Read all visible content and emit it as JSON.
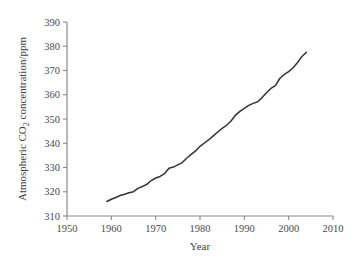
{
  "chart_data": {
    "type": "line",
    "title": "",
    "xlabel": "Year",
    "ylabel": "Atmospheric CO2 concentration/ppm",
    "ylabel_parts": {
      "pre": "Atmospheric CO",
      "sub": "2",
      "post": " concentration/ppm"
    },
    "xlim": [
      1950,
      2010
    ],
    "ylim": [
      310,
      390
    ],
    "xticks": [
      1950,
      1960,
      1970,
      1980,
      1990,
      2000,
      2010
    ],
    "xtick_labels": [
      "1950",
      "1960",
      "1970",
      "1980",
      "1990",
      "2000",
      "2010"
    ],
    "yticks": [
      310,
      320,
      330,
      340,
      350,
      360,
      370,
      380,
      390
    ],
    "ytick_labels": [
      "310",
      "320",
      "330",
      "340",
      "350",
      "360",
      "370",
      "380",
      "390"
    ],
    "grid": false,
    "legend": false,
    "legend_position": "none",
    "line_color": "#333333",
    "axis_color": "#8a8a8a",
    "series": [
      {
        "name": "Atmospheric CO2 concentration",
        "x": [
          1959,
          1960,
          1961,
          1962,
          1963,
          1964,
          1965,
          1966,
          1967,
          1968,
          1969,
          1970,
          1971,
          1972,
          1973,
          1974,
          1975,
          1976,
          1977,
          1978,
          1979,
          1980,
          1981,
          1982,
          1983,
          1984,
          1985,
          1986,
          1987,
          1988,
          1989,
          1990,
          1991,
          1992,
          1993,
          1994,
          1995,
          1996,
          1997,
          1998,
          1999,
          2000,
          2001,
          2002,
          2003,
          2004
        ],
        "values": [
          315.97,
          316.91,
          317.64,
          318.45,
          318.99,
          319.62,
          320.04,
          321.38,
          322.16,
          323.04,
          324.62,
          325.68,
          326.32,
          327.45,
          329.68,
          330.18,
          331.11,
          332.04,
          333.83,
          335.4,
          336.84,
          338.75,
          340.11,
          341.45,
          343.05,
          344.65,
          346.12,
          347.42,
          349.19,
          351.57,
          353.12,
          354.39,
          355.61,
          356.45,
          357.1,
          358.83,
          360.82,
          362.61,
          363.73,
          366.7,
          368.38,
          369.55,
          371.14,
          373.28,
          375.8,
          377.52
        ]
      }
    ]
  },
  "axes": {
    "x_axis_name": "x-axis",
    "y_axis_name": "y-axis"
  }
}
